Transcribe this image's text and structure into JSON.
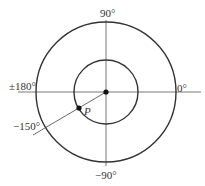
{
  "diagram": {
    "center": {
      "x": 106,
      "y": 92
    },
    "outer_radius": 70,
    "inner_radius": 32,
    "stroke_color": "#333333",
    "labels": {
      "top": "90°",
      "right": "0°",
      "left": "±180°",
      "bottom": "−90°",
      "ray": "−150°",
      "point": "P"
    }
  }
}
